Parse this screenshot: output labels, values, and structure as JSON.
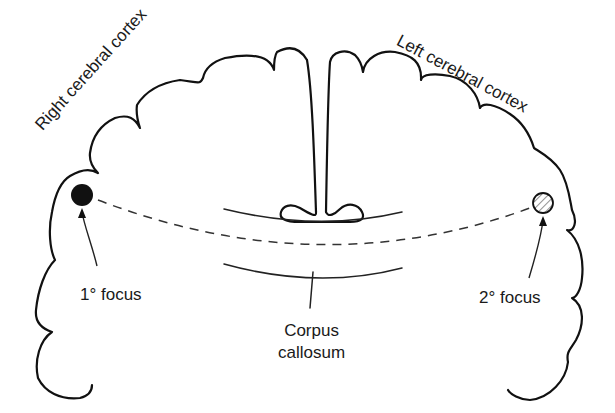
{
  "diagram": {
    "title": "",
    "labels": {
      "right_cortex": "Right cerebral cortex",
      "left_cortex": "Left cerebral cortex",
      "primary_focus": "1° focus",
      "secondary_focus": "2° focus",
      "corpus_line1": "Corpus",
      "corpus_line2": "callosum"
    },
    "nodes": [
      {
        "id": "primary_focus",
        "shape": "filled-circle",
        "color": "#111111"
      },
      {
        "id": "secondary_focus",
        "shape": "hatched-circle",
        "color": "#888888"
      }
    ],
    "edges": [
      {
        "from": "primary_focus",
        "to": "secondary_focus",
        "style": "dashed",
        "label": ""
      }
    ]
  }
}
